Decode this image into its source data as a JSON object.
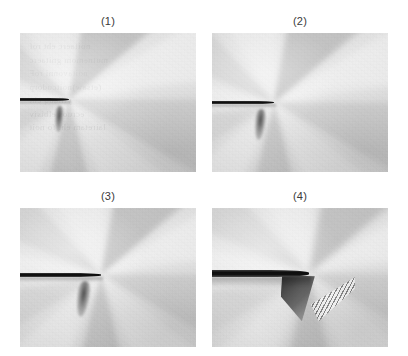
{
  "figure": {
    "background_color": "#ffffff",
    "label_color": "#3a3a3a",
    "panel_count": 4,
    "layout": "2x2 grid",
    "image_type": "grayscale photoelastic fringe / caustic photographs of a propagating crack tip",
    "ghost_text": "ghost bleed-through text, illegible"
  },
  "panels": [
    {
      "id": "panel-1",
      "label": "(1)",
      "x": 20,
      "y": 33,
      "width": 176,
      "height": 139,
      "crack_length_pct": 28,
      "crack_thickness_px": 3,
      "crack_y_pct": 48,
      "tip_x_pct": 28,
      "has_striations": false,
      "has_ghost_text": true,
      "base_tone": "#e6e6e6"
    },
    {
      "id": "panel-2",
      "label": "(2)",
      "x": 212,
      "y": 33,
      "width": 176,
      "height": 139,
      "crack_length_pct": 35,
      "crack_thickness_px": 3,
      "crack_y_pct": 50,
      "tip_x_pct": 35,
      "has_striations": false,
      "has_ghost_text": false,
      "base_tone": "#e1e1e1"
    },
    {
      "id": "panel-3",
      "label": "(3)",
      "x": 20,
      "y": 208,
      "width": 176,
      "height": 139,
      "crack_length_pct": 46,
      "crack_thickness_px": 4,
      "crack_y_pct": 48,
      "tip_x_pct": 46,
      "has_striations": false,
      "has_ghost_text": false,
      "base_tone": "#dedede"
    },
    {
      "id": "panel-4",
      "label": "(4)",
      "x": 212,
      "y": 208,
      "width": 176,
      "height": 139,
      "crack_length_pct": 55,
      "crack_thickness_px": 7,
      "crack_y_pct": 47,
      "tip_x_pct": 55,
      "has_striations": true,
      "has_ghost_text": false,
      "base_tone": "#dcdcdc"
    }
  ],
  "ghost": {
    "lines": "noitaerc eht rof\nmutnemom gnitaerc\nnoitavonni roF\n(etsaw)noitcudorp\nytilauq eht\necruos elbisiv\nlairetam eht fo noit"
  }
}
